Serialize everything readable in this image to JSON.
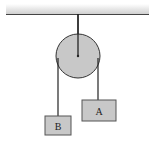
{
  "diagram": {
    "type": "pulley-system",
    "colors": {
      "ceiling": "#d9d9d9",
      "line": "#333333",
      "pulley_fill": "#c8c8c8",
      "block_fill": "#c8c8c8",
      "rope": "#222222"
    },
    "blocks": [
      {
        "label": "A"
      },
      {
        "label": "B"
      }
    ]
  }
}
